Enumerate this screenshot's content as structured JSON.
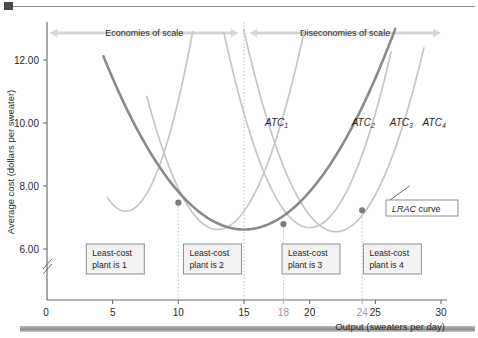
{
  "figure": {
    "corner_mark": "black-square-marker",
    "bottom_bar": "grey-rule"
  },
  "chart_data": {
    "type": "line",
    "title": "",
    "xlabel": "Output (sweaters per day)",
    "ylabel": "Average cost (dollars per sweater)",
    "xlim": [
      0,
      30
    ],
    "ylim": [
      5.2,
      12.6
    ],
    "grid": false,
    "axis_break": true,
    "xticks": [
      0,
      5,
      10,
      15,
      18,
      20,
      24,
      25,
      30
    ],
    "xtick_labels": [
      "0",
      "5",
      "10",
      "15",
      "18",
      "20",
      "24",
      "25",
      "30"
    ],
    "xtick_greyed": [
      18,
      24
    ],
    "yticks": [
      6.0,
      8.0,
      10.0,
      12.0
    ],
    "ytick_labels": [
      "6.00",
      "8.00",
      "10.00",
      "12.00"
    ],
    "series": [
      {
        "name": "ATC_1",
        "label": "ATC",
        "subscript": "1",
        "color": "#c6c6c6",
        "vertex_x": 6.0,
        "vertex_y": 7.2,
        "curvature": 0.22,
        "x_start": 4.6,
        "x_end": 16.1,
        "label_x": 16.6,
        "label_y": 9.92
      },
      {
        "name": "ATC_2",
        "label": "ATC",
        "subscript": "2",
        "color": "#c6c6c6",
        "vertex_x": 13.0,
        "vertex_y": 6.62,
        "curvature": 0.145,
        "x_start": 7.6,
        "x_end": 22.6,
        "label_x": 23.2,
        "label_y": 9.92
      },
      {
        "name": "ATC_3",
        "label": "ATC",
        "subscript": "3",
        "color": "#c6c6c6",
        "vertex_x": 20.0,
        "vertex_y": 6.68,
        "curvature": 0.145,
        "x_start": 10.7,
        "x_end": 26.2,
        "label_x": 26.1,
        "label_y": 9.92
      },
      {
        "name": "ATC_4",
        "label": "ATC",
        "subscript": "4",
        "color": "#c6c6c6",
        "vertex_x": 22.0,
        "vertex_y": 6.55,
        "curvature": 0.13,
        "x_start": 13.2,
        "x_end": 28.7,
        "label_x": 28.6,
        "label_y": 9.92
      },
      {
        "name": "LRAC",
        "label": "LRAC curve",
        "color": "#8a8a8a",
        "vertex_x": 15.0,
        "vertex_y": 6.62,
        "curvature": 0.048,
        "x_start": 4.3,
        "x_end": 28.6
      }
    ],
    "intersection_points": [
      {
        "x": 10,
        "y": 7.47,
        "label": "plant-1-2-switch"
      },
      {
        "x": 18,
        "y": 6.79,
        "label": "plant-2-3-switch"
      },
      {
        "x": 24,
        "y": 7.23,
        "label": "plant-3-4-switch"
      }
    ],
    "dropline_x": [
      10,
      15,
      18,
      24
    ],
    "annotations": {
      "bands": [
        {
          "name": "economies-of-scale",
          "text": "Economies of scale",
          "x_from": 0.2,
          "x_to": 14.6
        },
        {
          "name": "diseconomies-of-scale",
          "text": "Diseconomies of scale",
          "x_from": 15.4,
          "x_to": 30.0
        }
      ],
      "callout": {
        "name": "lrac-curve-callout",
        "italic_part": "LRAC",
        "plain_part": " curve"
      },
      "plant_boxes": [
        {
          "line1": "Least-cost",
          "line2": "plant is 1",
          "x_center": 5.2
        },
        {
          "line1": "Least-cost",
          "line2": "plant is 2",
          "x_center": 12.6
        },
        {
          "line1": "Least-cost",
          "line2": "plant is 3",
          "x_center": 20.1
        },
        {
          "line1": "Least-cost",
          "line2": "plant is 4",
          "x_center": 26.3
        }
      ]
    }
  },
  "colors": {
    "atc_curve": "#c6c6c6",
    "lrac_curve": "#8a8a8a",
    "band_fill": "#d9d9d9",
    "axis": "#6f6f6f",
    "marker": "#7c7c7c",
    "box_border": "#8f8f8f",
    "box_fill": "#f2f2f2"
  }
}
